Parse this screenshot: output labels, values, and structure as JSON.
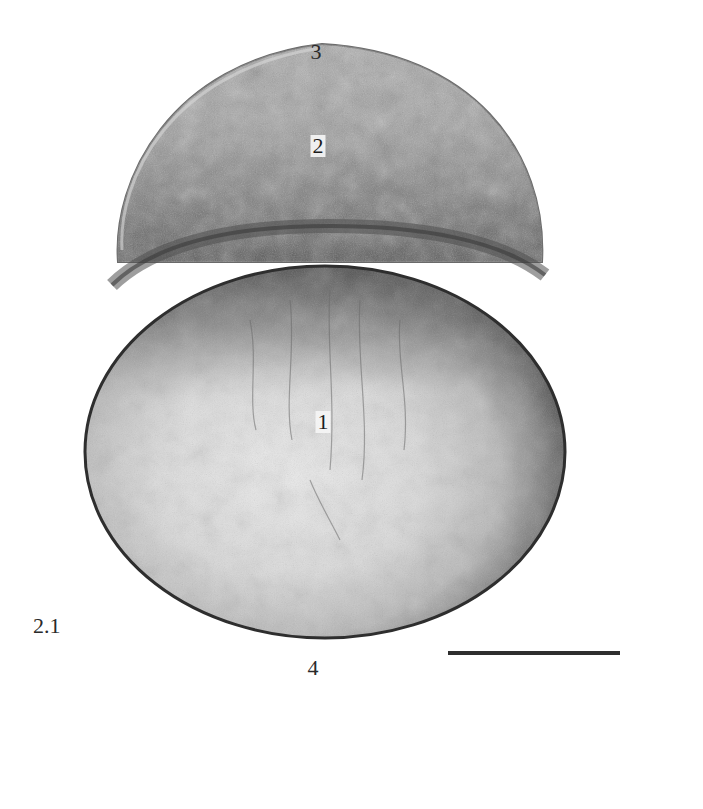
{
  "figure": {
    "panel_label": "2.1",
    "structure_labels": [
      {
        "id": "1",
        "text": "1",
        "position": "yolk-cell-center"
      },
      {
        "id": "2",
        "text": "2",
        "position": "blastoderm-center"
      },
      {
        "id": "3",
        "text": "3",
        "position": "animal-pole-top"
      },
      {
        "id": "4",
        "text": "4",
        "position": "vegetal-pole-bottom"
      }
    ],
    "scale_bar": {
      "x_start": 448,
      "x_end": 620,
      "y": 653,
      "color": "#2e2e2e"
    },
    "colors": {
      "background": "#ffffff",
      "blastoderm": "#9a9a9a",
      "boundary_band": "#5e5e5e",
      "yolk_center": "#e6e6e6",
      "yolk_rim": "#3a3a3a"
    }
  }
}
